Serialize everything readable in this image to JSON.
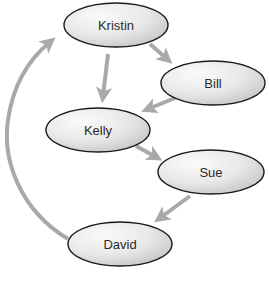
{
  "diagram": {
    "colors": {
      "arrow": "#a9a9a9",
      "node_stroke": "#1a1a1a",
      "node_fill_light": "#f7f7f7",
      "node_fill_dark": "#c8c8c8",
      "background": "#ffffff"
    },
    "nodes": [
      {
        "id": "kristin",
        "label": "Kristin",
        "cx": 116,
        "cy": 25,
        "rx": 52,
        "ry": 22
      },
      {
        "id": "bill",
        "label": "Bill",
        "cx": 213,
        "cy": 83,
        "rx": 52,
        "ry": 22
      },
      {
        "id": "kelly",
        "label": "Kelly",
        "cx": 98,
        "cy": 130,
        "rx": 52,
        "ry": 22
      },
      {
        "id": "sue",
        "label": "Sue",
        "cx": 211,
        "cy": 172,
        "rx": 53,
        "ry": 22
      },
      {
        "id": "david",
        "label": "David",
        "cx": 120,
        "cy": 244,
        "rx": 52,
        "ry": 22
      }
    ],
    "edges": [
      {
        "from": "Kristin",
        "to": "Kelly"
      },
      {
        "from": "Kristin",
        "to": "Bill"
      },
      {
        "from": "Bill",
        "to": "Kelly"
      },
      {
        "from": "Kelly",
        "to": "Sue"
      },
      {
        "from": "Sue",
        "to": "David"
      },
      {
        "from": "David",
        "to": "Kristin"
      }
    ]
  }
}
